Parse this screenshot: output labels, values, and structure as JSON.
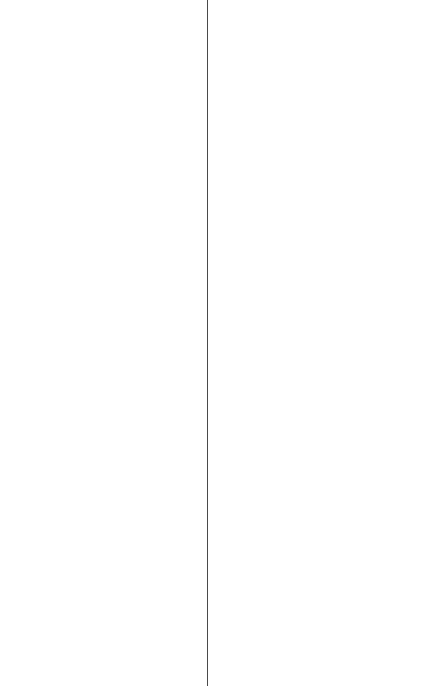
{
  "canvas": {
    "background": "#ffffff",
    "divider_color": "#4a4a4a"
  }
}
